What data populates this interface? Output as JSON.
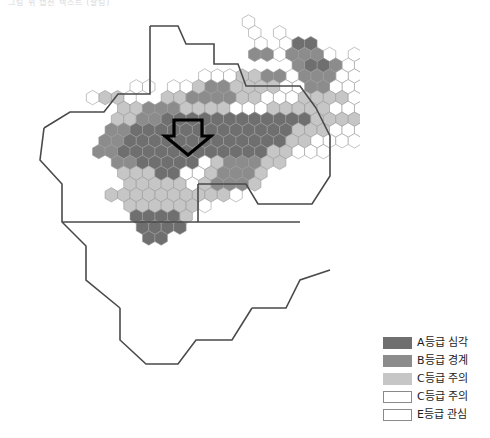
{
  "caption": {
    "text": "그림 위 캡션 텍스트 (잘림)"
  },
  "map": {
    "title": "전국 시군구 등급 지도",
    "type": "hex-cartogram",
    "annotation": {
      "name": "down-arrow-pointer",
      "shape": "arrow-down",
      "color": "#000000",
      "fill": "none"
    },
    "palette": {
      "A": "#6f6f6f",
      "B": "#8c8c8c",
      "C1": "#c6c6c6",
      "C2": "#ffffff",
      "E": "#ffffff",
      "outline": "#4a4a4a",
      "hairline": "#9a9a9a"
    },
    "regions": [
      {
        "id": "r01",
        "label": "철원군",
        "grade": "E"
      },
      {
        "id": "r02",
        "label": "화천군",
        "grade": "E"
      },
      {
        "id": "r03",
        "label": "양구군",
        "grade": "E"
      },
      {
        "id": "r04",
        "label": "고성군",
        "grade": "E"
      },
      {
        "id": "r05",
        "label": "인제군",
        "grade": "E"
      },
      {
        "id": "r06",
        "label": "속초시",
        "grade": "E"
      },
      {
        "id": "r07",
        "label": "양양군",
        "grade": "E"
      },
      {
        "id": "r08",
        "label": "춘천시",
        "grade": "E"
      },
      {
        "id": "r09",
        "label": "홍천군",
        "grade": "E"
      },
      {
        "id": "r10",
        "label": "강릉시",
        "grade": "E"
      },
      {
        "id": "r11",
        "label": "횡성군",
        "grade": "E"
      },
      {
        "id": "r12",
        "label": "평창군",
        "grade": "E"
      },
      {
        "id": "r13",
        "label": "정선군",
        "grade": "E"
      },
      {
        "id": "r14",
        "label": "동해시",
        "grade": "E"
      },
      {
        "id": "r15",
        "label": "원주시",
        "grade": "E"
      },
      {
        "id": "r16",
        "label": "영월군",
        "grade": "E"
      },
      {
        "id": "r17",
        "label": "태백시",
        "grade": "E"
      },
      {
        "id": "r18",
        "label": "삼척시",
        "grade": "E"
      },
      {
        "id": "r19",
        "label": "파주시",
        "grade": "B"
      },
      {
        "id": "r20",
        "label": "연천군",
        "grade": "C2"
      },
      {
        "id": "r21",
        "label": "포천시",
        "grade": "B"
      },
      {
        "id": "r22",
        "label": "동두천시",
        "grade": "A"
      },
      {
        "id": "r23",
        "label": "양주시",
        "grade": "B"
      },
      {
        "id": "r24",
        "label": "의정부시",
        "grade": "A"
      },
      {
        "id": "r25",
        "label": "가평군",
        "grade": "C2"
      },
      {
        "id": "r26",
        "label": "남양주시",
        "grade": "A"
      },
      {
        "id": "r27",
        "label": "고양시",
        "grade": "B"
      },
      {
        "id": "r28",
        "label": "김포시",
        "grade": "C1"
      },
      {
        "id": "r29",
        "label": "강화군",
        "grade": "C2"
      },
      {
        "id": "r30",
        "label": "인천 서구",
        "grade": "B"
      },
      {
        "id": "r31",
        "label": "부천시",
        "grade": "B"
      },
      {
        "id": "r32",
        "label": "서울 강북구",
        "grade": "A"
      },
      {
        "id": "r33",
        "label": "서울 노원구",
        "grade": "B"
      },
      {
        "id": "r34",
        "label": "서울 도봉구",
        "grade": "B"
      },
      {
        "id": "r35",
        "label": "서울 종로구",
        "grade": "C2"
      },
      {
        "id": "r36",
        "label": "서울 중구",
        "grade": "C2"
      },
      {
        "id": "r37",
        "label": "서울 성북구",
        "grade": "B"
      },
      {
        "id": "r38",
        "label": "서울 동대문구",
        "grade": "B"
      },
      {
        "id": "r39",
        "label": "서울 광진구",
        "grade": "B"
      },
      {
        "id": "r40",
        "label": "서울 마포구",
        "grade": "C1"
      },
      {
        "id": "r41",
        "label": "서울 용산구",
        "grade": "C1"
      },
      {
        "id": "r42",
        "label": "서울 강서구",
        "grade": "C1"
      },
      {
        "id": "r43",
        "label": "서울 양천구",
        "grade": "C1"
      },
      {
        "id": "r44",
        "label": "서울 영등포구",
        "grade": "A"
      },
      {
        "id": "r45",
        "label": "서울 동작구",
        "grade": "A"
      },
      {
        "id": "r46",
        "label": "서울 관악구",
        "grade": "A"
      },
      {
        "id": "r47",
        "label": "서울 서초구",
        "grade": "A"
      },
      {
        "id": "r48",
        "label": "서울 강남구",
        "grade": "A"
      },
      {
        "id": "r49",
        "label": "서울 송파구",
        "grade": "A"
      },
      {
        "id": "r50",
        "label": "서울 강동구",
        "grade": "A"
      },
      {
        "id": "r51",
        "label": "하남시",
        "grade": "C1"
      },
      {
        "id": "r52",
        "label": "광주시",
        "grade": "C1"
      },
      {
        "id": "r53",
        "label": "성남시",
        "grade": "A"
      },
      {
        "id": "r54",
        "label": "용인시",
        "grade": "A"
      },
      {
        "id": "r55",
        "label": "수원시",
        "grade": "A"
      },
      {
        "id": "r56",
        "label": "안양시",
        "grade": "A"
      },
      {
        "id": "r57",
        "label": "시흥시",
        "grade": "A"
      },
      {
        "id": "r58",
        "label": "안산시",
        "grade": "A"
      },
      {
        "id": "r59",
        "label": "화성시",
        "grade": "A"
      },
      {
        "id": "r60",
        "label": "오산시",
        "grade": "A"
      },
      {
        "id": "r61",
        "label": "평택시",
        "grade": "A"
      },
      {
        "id": "r62",
        "label": "이천시",
        "grade": "C1"
      },
      {
        "id": "r63",
        "label": "여주시",
        "grade": "C1"
      },
      {
        "id": "r64",
        "label": "안성시",
        "grade": "C1"
      },
      {
        "id": "r65",
        "label": "천안시",
        "grade": "B"
      },
      {
        "id": "r66",
        "label": "아산시",
        "grade": "B"
      },
      {
        "id": "r67",
        "label": "당진시",
        "grade": "C1"
      },
      {
        "id": "r68",
        "label": "서산시",
        "grade": "C1"
      },
      {
        "id": "r69",
        "label": "태안군",
        "grade": "C1"
      },
      {
        "id": "r70",
        "label": "홍성군",
        "grade": "C1"
      },
      {
        "id": "r71",
        "label": "예산군",
        "grade": "C1"
      },
      {
        "id": "r72",
        "label": "공주시",
        "grade": "C1"
      },
      {
        "id": "r73",
        "label": "세종특별자치시",
        "grade": "C1"
      },
      {
        "id": "r74",
        "label": "대전 유성구",
        "grade": "B"
      },
      {
        "id": "r75",
        "label": "대전 서구",
        "grade": "B"
      },
      {
        "id": "r76",
        "label": "대전 중구",
        "grade": "B"
      },
      {
        "id": "r77",
        "label": "대전 동구",
        "grade": "B"
      },
      {
        "id": "r78",
        "label": "대전 대덕구",
        "grade": "B"
      },
      {
        "id": "r79",
        "label": "청주시",
        "grade": "B"
      },
      {
        "id": "r80",
        "label": "증평군",
        "grade": "C2"
      },
      {
        "id": "r81",
        "label": "진천군",
        "grade": "C2"
      },
      {
        "id": "r82",
        "label": "음성군",
        "grade": "C2"
      },
      {
        "id": "r83",
        "label": "충주시",
        "grade": "C2"
      },
      {
        "id": "r84",
        "label": "제천시",
        "grade": "C2"
      },
      {
        "id": "r85",
        "label": "단양군",
        "grade": "C2"
      },
      {
        "id": "r86",
        "label": "괴산군",
        "grade": "C2"
      },
      {
        "id": "r87",
        "label": "보은군",
        "grade": "C2"
      },
      {
        "id": "r88",
        "label": "옥천군",
        "grade": "C2"
      },
      {
        "id": "r89",
        "label": "영동군",
        "grade": "C2"
      },
      {
        "id": "r90",
        "label": "금산군",
        "grade": "C2"
      },
      {
        "id": "r91",
        "label": "논산시",
        "grade": "C1"
      },
      {
        "id": "r92",
        "label": "계룡시",
        "grade": "C1"
      },
      {
        "id": "r93",
        "label": "부여군",
        "grade": "C1"
      },
      {
        "id": "r94",
        "label": "청양군",
        "grade": "C1"
      },
      {
        "id": "r95",
        "label": "보령시",
        "grade": "C1"
      },
      {
        "id": "r96",
        "label": "서천군",
        "grade": "C1"
      },
      {
        "id": "r97",
        "label": "군산시",
        "grade": "C1"
      },
      {
        "id": "r98",
        "label": "익산시",
        "grade": "C1"
      },
      {
        "id": "r99",
        "label": "전주시",
        "grade": "C1"
      },
      {
        "id": "r100",
        "label": "완주군",
        "grade": "C1"
      },
      {
        "id": "r101",
        "label": "김제시",
        "grade": "C1"
      },
      {
        "id": "r102",
        "label": "부안군",
        "grade": "C1"
      },
      {
        "id": "r103",
        "label": "정읍시",
        "grade": "C1"
      },
      {
        "id": "r104",
        "label": "고창군",
        "grade": "C1"
      },
      {
        "id": "r105",
        "label": "순창군",
        "grade": "C1"
      },
      {
        "id": "r106",
        "label": "남원시",
        "grade": "C1"
      },
      {
        "id": "r107",
        "label": "임실군",
        "grade": "C1"
      },
      {
        "id": "r108",
        "label": "진안군",
        "grade": "C1"
      },
      {
        "id": "r109",
        "label": "무주군",
        "grade": "C1"
      },
      {
        "id": "r110",
        "label": "장수군",
        "grade": "C1"
      },
      {
        "id": "r111",
        "label": "영광군",
        "grade": "A"
      },
      {
        "id": "r112",
        "label": "함평군",
        "grade": "A"
      },
      {
        "id": "r113",
        "label": "나주시",
        "grade": "A"
      },
      {
        "id": "r114",
        "label": "광주 북구",
        "grade": "A"
      },
      {
        "id": "r115",
        "label": "광주 광산구",
        "grade": "A"
      },
      {
        "id": "r116",
        "label": "담양군",
        "grade": "A"
      },
      {
        "id": "r117",
        "label": "장성군",
        "grade": "A"
      },
      {
        "id": "r118",
        "label": "목포시",
        "grade": "A"
      },
      {
        "id": "r119",
        "label": "무안군",
        "grade": "A"
      },
      {
        "id": "r120",
        "label": "신안군",
        "grade": "A"
      },
      {
        "id": "r121",
        "label": "해남군",
        "grade": "A"
      },
      {
        "id": "r122",
        "label": "진도군",
        "grade": "A"
      },
      {
        "id": "r123",
        "label": "완도군",
        "grade": "A"
      },
      {
        "id": "r124",
        "label": "강진군",
        "grade": "A"
      },
      {
        "id": "r125",
        "label": "장흥군",
        "grade": "A"
      },
      {
        "id": "r126",
        "label": "보성군",
        "grade": "A"
      },
      {
        "id": "r127",
        "label": "화순군",
        "grade": "A"
      },
      {
        "id": "r128",
        "label": "순천시",
        "grade": "A"
      },
      {
        "id": "r129",
        "label": "광양시",
        "grade": "A"
      },
      {
        "id": "r130",
        "label": "여수시",
        "grade": "A"
      },
      {
        "id": "r131",
        "label": "구례군",
        "grade": "A"
      },
      {
        "id": "r132",
        "label": "곡성군",
        "grade": "A"
      },
      {
        "id": "r133",
        "label": "하동군",
        "grade": "C1"
      },
      {
        "id": "r134",
        "label": "산청군",
        "grade": "C1"
      },
      {
        "id": "r135",
        "label": "함양군",
        "grade": "C1"
      },
      {
        "id": "r136",
        "label": "거창군",
        "grade": "C1"
      },
      {
        "id": "r137",
        "label": "합천군",
        "grade": "C1"
      },
      {
        "id": "r138",
        "label": "진주시",
        "grade": "C1"
      },
      {
        "id": "r139",
        "label": "사천시",
        "grade": "C1"
      },
      {
        "id": "r140",
        "label": "남해군",
        "grade": "C1"
      },
      {
        "id": "r141",
        "label": "통영시",
        "grade": "C1"
      },
      {
        "id": "r142",
        "label": "거제시",
        "grade": "C1"
      },
      {
        "id": "r143",
        "label": "고성군",
        "grade": "C1"
      },
      {
        "id": "r144",
        "label": "창원시",
        "grade": "B"
      },
      {
        "id": "r145",
        "label": "김해시",
        "grade": "B"
      },
      {
        "id": "r146",
        "label": "밀양시",
        "grade": "B"
      },
      {
        "id": "r147",
        "label": "양산시",
        "grade": "B"
      },
      {
        "id": "r148",
        "label": "부산 북구",
        "grade": "B"
      },
      {
        "id": "r149",
        "label": "부산 사하구",
        "grade": "B"
      },
      {
        "id": "r150",
        "label": "부산 해운대구",
        "grade": "B"
      },
      {
        "id": "r151",
        "label": "울산 울주군",
        "grade": "B"
      },
      {
        "id": "r152",
        "label": "울산 남구",
        "grade": "B"
      },
      {
        "id": "r153",
        "label": "경주시",
        "grade": "C2"
      },
      {
        "id": "r154",
        "label": "포항시",
        "grade": "C1"
      },
      {
        "id": "r155",
        "label": "영천시",
        "grade": "C2"
      },
      {
        "id": "r156",
        "label": "경산시",
        "grade": "C2"
      },
      {
        "id": "r157",
        "label": "대구 수성구",
        "grade": "C1"
      },
      {
        "id": "r158",
        "label": "대구 달서구",
        "grade": "C1"
      },
      {
        "id": "r159",
        "label": "청도군",
        "grade": "C2"
      },
      {
        "id": "r160",
        "label": "창녕군",
        "grade": "C1"
      },
      {
        "id": "r161",
        "label": "고령군",
        "grade": "C1"
      },
      {
        "id": "r162",
        "label": "성주군",
        "grade": "C2"
      },
      {
        "id": "r163",
        "label": "칠곡군",
        "grade": "C2"
      },
      {
        "id": "r164",
        "label": "구미시",
        "grade": "C2"
      },
      {
        "id": "r165",
        "label": "김천시",
        "grade": "C2"
      },
      {
        "id": "r166",
        "label": "상주시",
        "grade": "C2"
      },
      {
        "id": "r167",
        "label": "문경시",
        "grade": "C2"
      },
      {
        "id": "r168",
        "label": "예천군",
        "grade": "C2"
      },
      {
        "id": "r169",
        "label": "안동시",
        "grade": "C2"
      },
      {
        "id": "r170",
        "label": "의성군",
        "grade": "C2"
      },
      {
        "id": "r171",
        "label": "군위군",
        "grade": "C2"
      },
      {
        "id": "r172",
        "label": "청송군",
        "grade": "C2"
      },
      {
        "id": "r173",
        "label": "영덕군",
        "grade": "C2"
      },
      {
        "id": "r174",
        "label": "영양군",
        "grade": "C2"
      },
      {
        "id": "r175",
        "label": "봉화군",
        "grade": "C2"
      },
      {
        "id": "r176",
        "label": "영주시",
        "grade": "C2"
      },
      {
        "id": "r177",
        "label": "울진군",
        "grade": "C2"
      },
      {
        "id": "r178",
        "label": "제주시",
        "grade": "A"
      },
      {
        "id": "r179",
        "label": "서귀포시",
        "grade": "A"
      }
    ]
  },
  "legend": {
    "items": [
      {
        "label": "A등급 심각",
        "color": "#6f6f6f",
        "border": "#6f6f6f"
      },
      {
        "label": "B등급 경계",
        "color": "#8c8c8c",
        "border": "#8c8c8c"
      },
      {
        "label": "C등급 주의",
        "color": "#c6c6c6",
        "border": "#c6c6c6"
      },
      {
        "label": "C등급 주의",
        "color": "#ffffff",
        "border": "#8a8a8a"
      },
      {
        "label": "E등급 관심",
        "color": "#ffffff",
        "border": "#8a8a8a"
      }
    ]
  }
}
